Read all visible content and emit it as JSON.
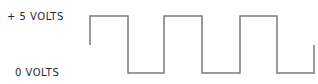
{
  "diagram": {
    "labels": {
      "high": "+ 5 VOLTS",
      "low": "0 VOLTS"
    },
    "line_color": "#7a7a7a",
    "waveform": {
      "type": "square",
      "high_level": "+5 V",
      "low_level": "0 V",
      "points": "90,45 90,16 128,16 128,73 164,73 164,16 202,16 202,73 240,73 240,16 277,16 277,73 314,73 314,45"
    }
  }
}
